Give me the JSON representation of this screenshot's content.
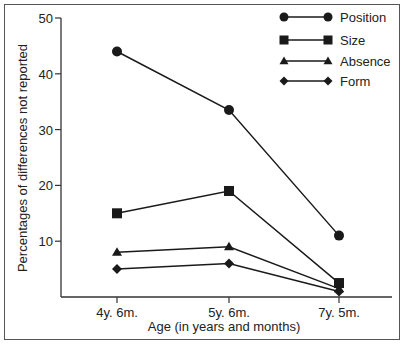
{
  "chart_data": {
    "type": "line",
    "title": "",
    "xlabel": "Age (in years and months)",
    "ylabel": "Percentages of differences not reported",
    "categories": [
      "4y. 6m.",
      "5y. 6m.",
      "7y. 5m."
    ],
    "series": [
      {
        "name": "Position",
        "marker": "circle",
        "values": [
          44,
          33.5,
          11
        ]
      },
      {
        "name": "Size",
        "marker": "square",
        "values": [
          15,
          19,
          2.5
        ]
      },
      {
        "name": "Absence",
        "marker": "triangle",
        "values": [
          8,
          9,
          1.5
        ]
      },
      {
        "name": "Form",
        "marker": "diamond",
        "values": [
          5,
          6,
          1
        ]
      }
    ],
    "ylim": [
      0,
      50
    ],
    "yticks": [
      10,
      20,
      30,
      40,
      50
    ],
    "grid": false,
    "legend_position": "top-right"
  },
  "colors": {
    "line": "#1a1a1a",
    "axis": "#333333",
    "frame": "#555555"
  }
}
